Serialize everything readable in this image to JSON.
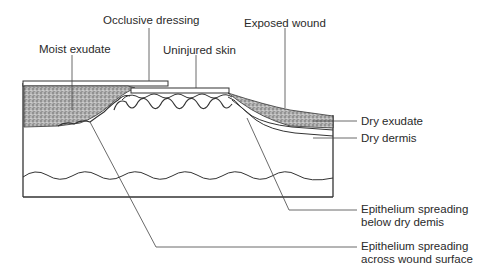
{
  "diagram": {
    "labels": {
      "occlusive_dressing": "Occlusive dressing",
      "exposed_wound": "Exposed wound",
      "moist_exudate": "Moist exudate",
      "uninjured_skin": "Uninjured skin",
      "dry_exudate": "Dry exudate",
      "dry_dermis": "Dry dermis",
      "epithelium_below_line1": "Epithelium spreading",
      "epithelium_below_line2": "below dry demis",
      "epithelium_across_line1": "Epithelium spreading",
      "epithelium_across_line2": "across wound surface"
    },
    "colors": {
      "line": "#333333",
      "stipple": "#8a8a8a",
      "text": "#2a2a2a"
    }
  }
}
